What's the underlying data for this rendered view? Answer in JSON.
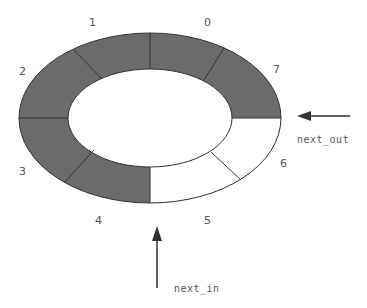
{
  "diagram": {
    "type": "circular-buffer",
    "colors": {
      "filled": "#6b6b6b",
      "empty": "#ffffff",
      "stroke": "#333333"
    },
    "slots": [
      {
        "index": "0",
        "filled": true
      },
      {
        "index": "1",
        "filled": true
      },
      {
        "index": "2",
        "filled": true
      },
      {
        "index": "3",
        "filled": true
      },
      {
        "index": "4",
        "filled": true
      },
      {
        "index": "5",
        "filled": false
      },
      {
        "index": "6",
        "filled": false
      },
      {
        "index": "7",
        "filled": true
      }
    ],
    "pointers": {
      "next_out": "next_out",
      "next_in": "next_in"
    }
  }
}
